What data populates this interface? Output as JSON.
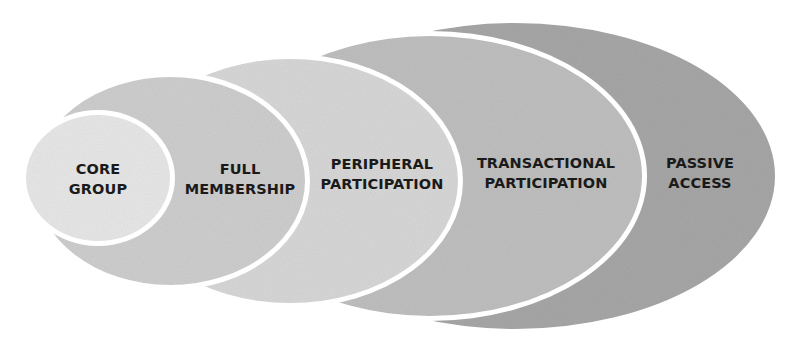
{
  "diagram": {
    "type": "nested-ellipses",
    "rings": [
      {
        "id": "passive-access",
        "line1": "PASSIVE",
        "line2": "ACCESS",
        "fill": "#a6a6a6",
        "ellipse": {
          "cx": 515,
          "cy": 176,
          "rx": 260,
          "ry": 153
        },
        "label_pos": {
          "x": 700,
          "y": 173
        }
      },
      {
        "id": "transactional-participation",
        "line1": "TRANSACTIONAL",
        "line2": "PARTICIPATION",
        "fill": "#bebebe",
        "ellipse": {
          "cx": 430,
          "cy": 176,
          "rx": 212,
          "ry": 140
        },
        "label_pos": {
          "x": 546,
          "y": 173
        }
      },
      {
        "id": "peripheral-participation",
        "line1": "PERIPHERAL",
        "line2": "PARTICIPATION",
        "fill": "#d6d6d6",
        "ellipse": {
          "cx": 290,
          "cy": 181,
          "rx": 168,
          "ry": 122
        },
        "label_pos": {
          "x": 382,
          "y": 174
        }
      },
      {
        "id": "full-membership",
        "line1": "FULL",
        "line2": "MEMBERSHIP",
        "fill": "#cdcdcd",
        "ellipse": {
          "cx": 170,
          "cy": 181,
          "rx": 135,
          "ry": 104
        },
        "label_pos": {
          "x": 240,
          "y": 179
        }
      },
      {
        "id": "core-group",
        "line1": "CORE",
        "line2": "GROUP",
        "fill": "#e6e6e6",
        "ellipse": {
          "cx": 98,
          "cy": 178,
          "rx": 72,
          "ry": 63
        },
        "label_pos": {
          "x": 98,
          "y": 179
        }
      }
    ],
    "gap_color": "#ffffff",
    "gap_width": 5
  }
}
